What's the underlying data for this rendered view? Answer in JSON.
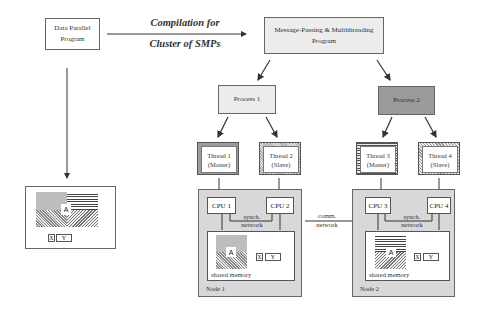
{
  "source_program": {
    "line1": "Data Parallel",
    "line2": "Program"
  },
  "compile_arrow": {
    "line1": "Compilation for",
    "line2": "Cluster of SMPs"
  },
  "target_program": {
    "line1": "Message-Passing & Multithreading",
    "line2": "Program"
  },
  "processes": [
    {
      "label": "Process 1"
    },
    {
      "label": "Process 2"
    }
  ],
  "threads": [
    {
      "line1": "Thread 1",
      "line2": "(Master)"
    },
    {
      "line1": "Thread 2",
      "line2": "(Slave)"
    },
    {
      "line1": "Thread 3",
      "line2": "(Master)"
    },
    {
      "line1": "Thread 4",
      "line2": "(Slave)"
    }
  ],
  "nodes": [
    {
      "label": "Node 1",
      "cpus": [
        "CPU 1",
        "CPU 2"
      ],
      "synch_line1": "synch.",
      "synch_line2": "network",
      "memory_label": "shared memory",
      "array": "A",
      "x": "X",
      "y": "Y"
    },
    {
      "label": "Node 2",
      "cpus": [
        "CPU 3",
        "CPU 4"
      ],
      "synch_line1": "synch.",
      "synch_line2": "network",
      "memory_label": "shared memory",
      "array": "A",
      "x": "X",
      "y": "Y"
    }
  ],
  "comm_network": {
    "line1": "comm.",
    "line2": "network"
  },
  "data_layout": {
    "array": "A",
    "x": "X",
    "y": "Y"
  }
}
